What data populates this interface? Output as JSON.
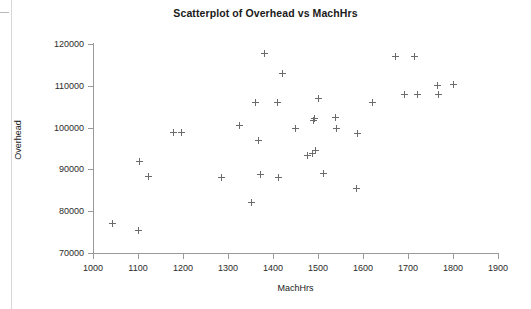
{
  "chart_data": {
    "type": "scatter",
    "title": "Scatterplot of Overhead vs MachHrs",
    "xlabel": "MachHrs",
    "ylabel": "Overhead",
    "xlim": [
      1000,
      1900
    ],
    "ylim": [
      70000,
      120000
    ],
    "xticks": [
      1000,
      1100,
      1200,
      1300,
      1400,
      1500,
      1600,
      1700,
      1800,
      1900
    ],
    "yticks": [
      70000,
      80000,
      90000,
      100000,
      110000,
      120000
    ],
    "xtick_labels": [
      "1000",
      "1100",
      "1200",
      "1300",
      "1400",
      "1500",
      "1600",
      "1700",
      "1800",
      "1900"
    ],
    "ytick_labels": [
      "70000",
      "80000",
      "90000",
      "100000",
      "110000",
      "120000"
    ],
    "grid": false,
    "legend": null,
    "marker": "plus",
    "marker_color": "#6b6b6b",
    "series": [
      {
        "name": "Overhead vs MachHrs",
        "points": [
          {
            "x": 1044,
            "y": 77000
          },
          {
            "x": 1102,
            "y": 75400
          },
          {
            "x": 1104,
            "y": 92000
          },
          {
            "x": 1124,
            "y": 88400
          },
          {
            "x": 1178,
            "y": 98900
          },
          {
            "x": 1196,
            "y": 98800
          },
          {
            "x": 1286,
            "y": 88000
          },
          {
            "x": 1326,
            "y": 100500
          },
          {
            "x": 1353,
            "y": 82200
          },
          {
            "x": 1362,
            "y": 106000
          },
          {
            "x": 1368,
            "y": 97000
          },
          {
            "x": 1373,
            "y": 88800
          },
          {
            "x": 1380,
            "y": 117800
          },
          {
            "x": 1411,
            "y": 105900
          },
          {
            "x": 1413,
            "y": 88100
          },
          {
            "x": 1422,
            "y": 113000
          },
          {
            "x": 1449,
            "y": 99800
          },
          {
            "x": 1476,
            "y": 93400
          },
          {
            "x": 1488,
            "y": 93800
          },
          {
            "x": 1491,
            "y": 101800
          },
          {
            "x": 1492,
            "y": 102200
          },
          {
            "x": 1495,
            "y": 94500
          },
          {
            "x": 1502,
            "y": 107000
          },
          {
            "x": 1513,
            "y": 88900
          },
          {
            "x": 1538,
            "y": 102400
          },
          {
            "x": 1540,
            "y": 99800
          },
          {
            "x": 1585,
            "y": 85500
          },
          {
            "x": 1588,
            "y": 98500
          },
          {
            "x": 1622,
            "y": 105900
          },
          {
            "x": 1673,
            "y": 117000
          },
          {
            "x": 1692,
            "y": 108000
          },
          {
            "x": 1715,
            "y": 117100
          },
          {
            "x": 1722,
            "y": 107800
          },
          {
            "x": 1765,
            "y": 110000
          },
          {
            "x": 1767,
            "y": 107800
          },
          {
            "x": 1802,
            "y": 110400
          }
        ]
      }
    ]
  }
}
